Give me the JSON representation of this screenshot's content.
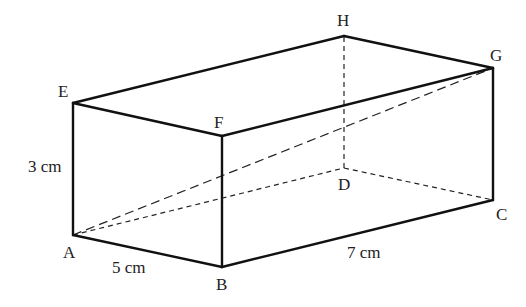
{
  "figure": {
    "type": "cuboid",
    "vertices": {
      "A": {
        "label": "A",
        "x": 73,
        "y": 235,
        "lx": 63,
        "ly": 258
      },
      "B": {
        "label": "B",
        "x": 222,
        "y": 267,
        "lx": 216,
        "ly": 290
      },
      "C": {
        "label": "C",
        "x": 493,
        "y": 200,
        "lx": 496,
        "ly": 220
      },
      "D": {
        "label": "D",
        "x": 344,
        "y": 168,
        "lx": 338,
        "ly": 190
      },
      "E": {
        "label": "E",
        "x": 73,
        "y": 103,
        "lx": 58,
        "ly": 97
      },
      "F": {
        "label": "F",
        "x": 222,
        "y": 136,
        "lx": 214,
        "ly": 128
      },
      "G": {
        "label": "G",
        "x": 493,
        "y": 68,
        "lx": 490,
        "ly": 61
      },
      "H": {
        "label": "H",
        "x": 344,
        "y": 36,
        "lx": 337,
        "ly": 26
      }
    },
    "dimensions": {
      "height": {
        "text": "3 cm",
        "x": 28,
        "y": 172
      },
      "width": {
        "text": "5 cm",
        "x": 112,
        "y": 273
      },
      "length": {
        "text": "7 cm",
        "x": 347,
        "y": 258
      }
    },
    "visible_edges": [
      [
        "A",
        "B"
      ],
      [
        "B",
        "C"
      ],
      [
        "C",
        "G"
      ],
      [
        "G",
        "H"
      ],
      [
        "H",
        "E"
      ],
      [
        "E",
        "A"
      ],
      [
        "E",
        "F"
      ],
      [
        "F",
        "G"
      ],
      [
        "F",
        "B"
      ]
    ],
    "hidden_edges": [
      [
        "A",
        "D"
      ],
      [
        "D",
        "C"
      ],
      [
        "D",
        "H"
      ]
    ],
    "diagonals": [
      [
        "A",
        "G"
      ]
    ]
  }
}
